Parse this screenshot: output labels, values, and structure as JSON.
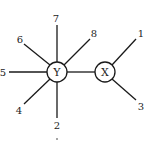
{
  "diagram": {
    "type": "tree",
    "internal_nodes": [
      {
        "id": "Y",
        "label": "Y"
      },
      {
        "id": "X",
        "label": "X"
      }
    ],
    "leaves": [
      {
        "id": "1",
        "label": "1",
        "parent": "X"
      },
      {
        "id": "2",
        "label": "2",
        "parent": "Y"
      },
      {
        "id": "3",
        "label": "3",
        "parent": "X"
      },
      {
        "id": "4",
        "label": "4",
        "parent": "Y"
      },
      {
        "id": "5",
        "label": "5",
        "parent": "Y"
      },
      {
        "id": "6",
        "label": "6",
        "parent": "Y"
      },
      {
        "id": "7",
        "label": "7",
        "parent": "Y"
      },
      {
        "id": "8",
        "label": "8",
        "parent": "Y"
      }
    ],
    "edges": [
      [
        "Y",
        "X"
      ],
      [
        "Y",
        "2"
      ],
      [
        "Y",
        "4"
      ],
      [
        "Y",
        "5"
      ],
      [
        "Y",
        "6"
      ],
      [
        "Y",
        "7"
      ],
      [
        "Y",
        "8"
      ],
      [
        "X",
        "1"
      ],
      [
        "X",
        "3"
      ]
    ],
    "colors": {
      "stroke": "#1a1a1a",
      "background": "#ffffff"
    }
  }
}
